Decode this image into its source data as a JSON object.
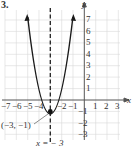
{
  "problem_number": "3.",
  "axes": {
    "x_label": "x",
    "y_label": "y",
    "x_ticks": [
      "−7",
      "−6",
      "−5",
      "−4",
      "−2",
      "−1",
      "1",
      "2",
      "3"
    ],
    "y_ticks": [
      "7",
      "6",
      "5",
      "4",
      "3",
      "2",
      "1",
      "−1",
      "−2",
      "−3"
    ]
  },
  "vertex_label": "(−3, −1)",
  "axis_of_symmetry_label": "x = − 3",
  "colors": {
    "curve": "#1a1a1a",
    "grid": "#d8d8d8",
    "axis": "#555555"
  }
}
